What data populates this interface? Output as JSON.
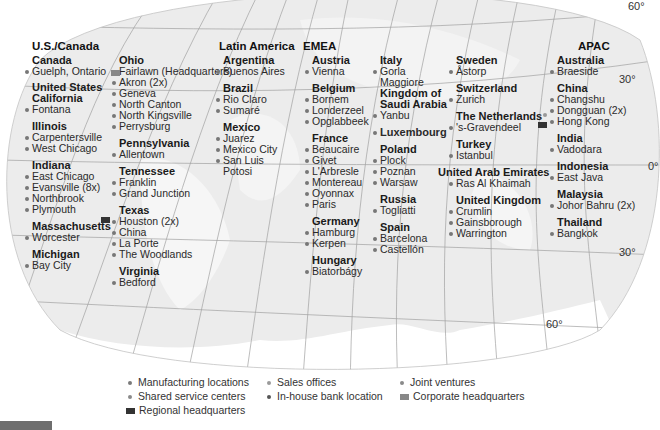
{
  "colors": {
    "map_fill": "#e9e9e9",
    "grid_line": "#9a9a9a",
    "manufacturing": "#7a7a7a",
    "sales": "#9a9a9a",
    "joint_venture": "#8a8a8a",
    "shared_service": "#8a8a8a",
    "in_house_bank": "#555555",
    "corporate_hq": "#888888",
    "regional_hq": "#333333"
  },
  "degrees": {
    "top_right_60": "60°",
    "right_30_north": "30°",
    "right_0": "0°",
    "right_30_south": "30°",
    "bottom_60": "60°"
  },
  "regions": {
    "us_canada": {
      "title": "U.S./Canada",
      "col1": {
        "canada": {
          "name": "Canada",
          "locations": [
            "Guelph, Ontario"
          ]
        },
        "us": {
          "name": "United States"
        },
        "california": {
          "name": "California",
          "locations": [
            "Fontana"
          ]
        },
        "illinois": {
          "name": "Illinois",
          "locations": [
            "Carpentersville",
            "West Chicago"
          ]
        },
        "indiana": {
          "name": "Indiana",
          "locations": [
            "East Chicago",
            "Evansville (8x)",
            "Northbrook",
            "Plymouth"
          ]
        },
        "massachusetts": {
          "name": "Massachusetts",
          "locations": [
            "Worcester"
          ]
        },
        "michigan": {
          "name": "Michigan",
          "locations": [
            "Bay City"
          ]
        }
      },
      "col2": {
        "ohio": {
          "name": "Ohio",
          "locations": [
            "Fairlawn (Headquarters)",
            "Akron (2x)",
            "Geneva",
            "North Canton",
            "North Kingsville",
            "Perrysburg"
          ]
        },
        "pennsylvania": {
          "name": "Pennsylvania",
          "locations": [
            "Allentown"
          ]
        },
        "tennessee": {
          "name": "Tennessee",
          "locations": [
            "Franklin",
            "Grand Junction"
          ]
        },
        "texas": {
          "name": "Texas",
          "locations": [
            "Houston (2x)",
            "China",
            "La Porte",
            "The Woodlands"
          ]
        },
        "virginia": {
          "name": "Virginia",
          "locations": [
            "Bedford"
          ]
        }
      }
    },
    "latin_america": {
      "title": "Latin America",
      "argentina": {
        "name": "Argentina",
        "locations": [
          "Buenos Aires"
        ]
      },
      "brazil": {
        "name": "Brazil",
        "locations": [
          "Rio Claro",
          "Sumaré"
        ]
      },
      "mexico": {
        "name": "Mexico",
        "locations": [
          "Juarez",
          "Mexico City",
          "San Luis",
          "Potosi"
        ]
      }
    },
    "emea": {
      "title": "EMEA",
      "col1": {
        "austria": {
          "name": "Austria",
          "locations": [
            "Vienna"
          ]
        },
        "belgium": {
          "name": "Belgium",
          "locations": [
            "Bornem",
            "Londerzeel",
            "Opglabbeek"
          ]
        },
        "france": {
          "name": "France",
          "locations": [
            "Beaucaire",
            "Givet",
            "L'Arbresle",
            "Montereau",
            "Oyonnax",
            "Paris"
          ]
        },
        "germany": {
          "name": "Germany",
          "locations": [
            "Hamburg",
            "Kerpen"
          ]
        },
        "hungary": {
          "name": "Hungary",
          "locations": [
            "Biatorbágy"
          ]
        }
      },
      "col2": {
        "italy": {
          "name": "Italy",
          "locations": [
            "Gorla",
            "Maggiore"
          ]
        },
        "saudi": {
          "name_line1": "Kingdom of",
          "name_line2": "Saudi Arabia",
          "locations": [
            "Yanbu"
          ]
        },
        "luxembourg": {
          "name": "Luxembourg"
        },
        "poland": {
          "name": "Poland",
          "locations": [
            "Plock",
            "Poznan",
            "Warsaw"
          ]
        },
        "russia": {
          "name": "Russia",
          "locations": [
            "Togliatti"
          ]
        },
        "spain": {
          "name": "Spain",
          "locations": [
            "Barcelona",
            "Castellón"
          ]
        }
      },
      "col3": {
        "sweden": {
          "name": "Sweden",
          "locations": [
            "Åstorp"
          ]
        },
        "switzerland": {
          "name": "Switzerland",
          "locations": [
            "Zurich"
          ]
        },
        "netherlands": {
          "name": "The Netherlands",
          "locations": [
            "'s-Gravendeel"
          ]
        },
        "turkey": {
          "name": "Turkey",
          "locations": [
            "Istanbul"
          ]
        },
        "uae": {
          "name": "United Arab Emirates",
          "locations": [
            "Ras Al Khaimah"
          ]
        },
        "uk": {
          "name": "United Kingdom",
          "locations": [
            "Crumlin",
            "Gainsborough",
            "Warrington"
          ]
        }
      }
    },
    "apac": {
      "title": "APAC",
      "australia": {
        "name": "Australia",
        "locations": [
          "Braeside"
        ]
      },
      "china": {
        "name": "China",
        "locations": [
          "Changshu",
          "Dongguan (2x)",
          "Hong Kong"
        ]
      },
      "india": {
        "name": "India",
        "locations": [
          "Vadodara"
        ]
      },
      "indonesia": {
        "name": "Indonesia",
        "locations": [
          "East Java"
        ]
      },
      "malaysia": {
        "name": "Malaysia",
        "locations": [
          "Johor Bahru (2x)"
        ]
      },
      "thailand": {
        "name": "Thailand",
        "locations": [
          "Bangkok"
        ]
      }
    }
  },
  "legend": {
    "manufacturing": "Manufacturing locations",
    "sales": "Sales offices",
    "joint_ventures": "Joint ventures",
    "shared_service": "Shared service centers",
    "in_house_bank": "In-house bank location",
    "corporate_hq": "Corporate headquarters",
    "regional_hq": "Regional headquarters"
  }
}
